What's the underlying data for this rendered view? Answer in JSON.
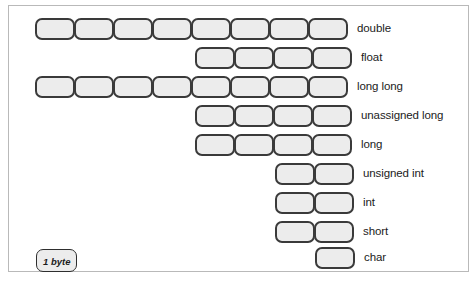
{
  "figure": {
    "frame_border_color": "#b9b9b9",
    "cell_fill_color": "#ececec",
    "cell_border_color": "#3a3a3a",
    "background_color": "#ffffff"
  },
  "legend": {
    "label": "1 byte",
    "note": "each rounded box represents one byte"
  },
  "rows": [
    {
      "label": "double",
      "bytes": 8,
      "top": 11,
      "left": 26
    },
    {
      "label": "float",
      "bytes": 4,
      "top": 40,
      "left": 186
    },
    {
      "label": "long long",
      "bytes": 8,
      "top": 69,
      "left": 26
    },
    {
      "label": "unassigned long",
      "bytes": 4,
      "top": 98,
      "left": 186
    },
    {
      "label": "long",
      "bytes": 4,
      "top": 127,
      "left": 186
    },
    {
      "label": "unsigned int",
      "bytes": 2,
      "top": 156,
      "left": 266
    },
    {
      "label": "int",
      "bytes": 2,
      "top": 185,
      "left": 266
    },
    {
      "label": "short",
      "bytes": 2,
      "top": 214,
      "left": 266
    },
    {
      "label": "char",
      "bytes": 1,
      "top": 240,
      "left": 306
    }
  ],
  "chart_data": {
    "type": "bar",
    "xlabel": "bytes",
    "ylabel": "",
    "unit": "1 byte",
    "categories": [
      "double",
      "float",
      "long long",
      "unassigned long",
      "long",
      "unsigned int",
      "int",
      "short",
      "char"
    ],
    "values": [
      8,
      4,
      8,
      4,
      4,
      2,
      2,
      2,
      1
    ],
    "xlim": [
      0,
      8
    ],
    "grid": false,
    "legend": "1 byte",
    "orientation": "horizontal",
    "alignment": "right-aligned"
  }
}
